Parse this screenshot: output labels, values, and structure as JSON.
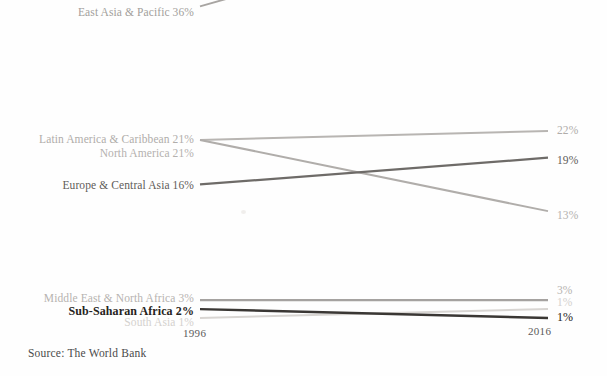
{
  "chart_data": {
    "type": "line",
    "title": "",
    "subtitle": "",
    "xlabel": "",
    "ylabel": "",
    "x": [
      "1996",
      "2016"
    ],
    "tick_labels": [
      "1996",
      "2016"
    ],
    "grid": false,
    "legend": "inline-endpoint-labels",
    "ylim": [
      0,
      40
    ],
    "source": "Source: The World Bank",
    "series": [
      {
        "name": "East Asia & Pacific",
        "left_label": "East Asia & Pacific 36%",
        "right_label": "",
        "values": [
          36,
          47
        ],
        "color": "#a8a5a2",
        "weight": 1.9,
        "label_color": "#a29f9c",
        "label_size": 11.5,
        "label_weight": "400"
      },
      {
        "name": "Latin America & Caribbean",
        "left_label": "Latin America & Caribbean 21%",
        "right_label": "22%",
        "values": [
          21,
          22
        ],
        "color": "#b8b5b2",
        "weight": 2.0,
        "label_color": "#b0adaa",
        "label_size": 11.5,
        "label_weight": "400"
      },
      {
        "name": "North America",
        "left_label": "North America 21%",
        "right_label": "13%",
        "values": [
          21,
          13
        ],
        "color": "#b0adaa",
        "weight": 2.0,
        "label_color": "#b4b1ae",
        "label_size": 11.5,
        "label_weight": "400"
      },
      {
        "name": "Europe & Central Asia",
        "left_label": "Europe & Central Asia 16%",
        "right_label": "19%",
        "values": [
          16,
          19
        ],
        "color": "#6e6b68",
        "weight": 2.3,
        "label_color": "#5f5c59",
        "label_size": 11.5,
        "label_weight": "400"
      },
      {
        "name": "Middle East & North Africa",
        "left_label": "Middle East & North Africa 3%",
        "right_label": "3%",
        "values": [
          3,
          3
        ],
        "color": "#a5a2a0",
        "weight": 2.2,
        "label_color": "#b6b3b0",
        "label_size": 11.5,
        "label_weight": "400"
      },
      {
        "name": "South Asia",
        "left_label": "South Asia 1%",
        "right_label": "1%",
        "values": [
          1,
          2
        ],
        "color": "#d8d5d2",
        "weight": 2.0,
        "label_color": "#d4d1ce",
        "label_size": 11.5,
        "label_weight": "400"
      },
      {
        "name": "Sub-Saharan Africa",
        "left_label": "Sub-Saharan Africa 2%",
        "right_label": "1%",
        "values": [
          2,
          1
        ],
        "color": "#3a3734",
        "weight": 2.4,
        "label_color": "#262320",
        "label_size": 12,
        "label_weight": "700"
      }
    ]
  },
  "axis": {
    "left_tick": "1996",
    "right_tick": "2016"
  },
  "footer": {
    "source": "Source: The World Bank"
  },
  "colors": {
    "background": "#fefefe",
    "dark_accent": "#262320",
    "mid_gray": "#6e6b68",
    "light_gray": "#b8b5b2",
    "faint_gray": "#d8d5d2"
  }
}
